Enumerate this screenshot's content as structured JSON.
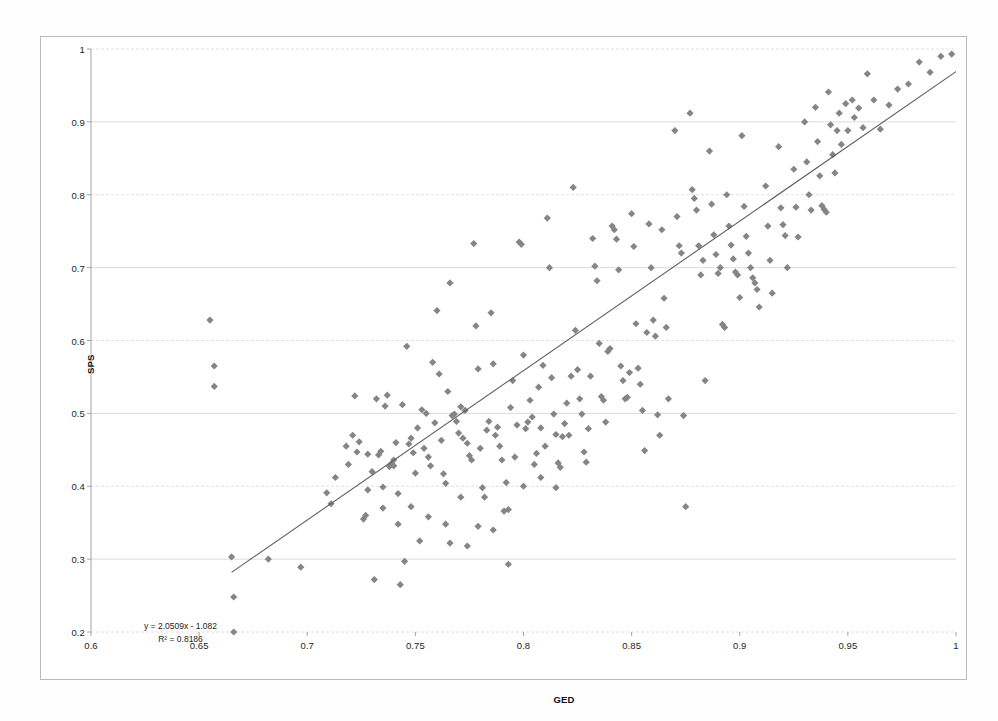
{
  "chart_data": {
    "type": "scatter",
    "title": "",
    "xlabel": "GED",
    "ylabel": "SPS",
    "xlim": [
      0.6,
      1.0
    ],
    "ylim": [
      0.2,
      1.0
    ],
    "xticks": [
      "0.6",
      "0.65",
      "0.7",
      "0.75",
      "0.8",
      "0.85",
      "0.9",
      "0.95",
      "1"
    ],
    "xtick_values": [
      0.6,
      0.65,
      0.7,
      0.75,
      0.8,
      0.85,
      0.9,
      0.95,
      1.0
    ],
    "yticks": [
      "0.2",
      "0.3",
      "0.4",
      "0.5",
      "0.6",
      "0.7",
      "0.8",
      "0.9",
      "1"
    ],
    "ytick_values": [
      0.2,
      0.3,
      0.4,
      0.5,
      0.6,
      0.7,
      0.8,
      0.9,
      1.0
    ],
    "grid": "horizontal",
    "legend": "none",
    "marker_shape": "diamond",
    "marker_color": "#858585",
    "trendline": {
      "type": "linear",
      "slope": 2.0509,
      "intercept": -1.082,
      "r_squared": 0.8186,
      "equation_text": "y = 2.0509x - 1.082",
      "r_squared_text": "R² = 0.8186",
      "color": "#595959",
      "x_start": 0.665,
      "x_end": 1.0
    },
    "n_points": 249,
    "points": [
      [
        0.655,
        0.628
      ],
      [
        0.657,
        0.565
      ],
      [
        0.657,
        0.537
      ],
      [
        0.665,
        0.303
      ],
      [
        0.666,
        0.248
      ],
      [
        0.666,
        0.2
      ],
      [
        0.682,
        0.3
      ],
      [
        0.697,
        0.289
      ],
      [
        0.709,
        0.391
      ],
      [
        0.711,
        0.376
      ],
      [
        0.713,
        0.412
      ],
      [
        0.718,
        0.455
      ],
      [
        0.719,
        0.43
      ],
      [
        0.721,
        0.47
      ],
      [
        0.722,
        0.524
      ],
      [
        0.723,
        0.447
      ],
      [
        0.724,
        0.461
      ],
      [
        0.726,
        0.355
      ],
      [
        0.727,
        0.36
      ],
      [
        0.728,
        0.444
      ],
      [
        0.73,
        0.42
      ],
      [
        0.731,
        0.272
      ],
      [
        0.732,
        0.52
      ],
      [
        0.733,
        0.443
      ],
      [
        0.734,
        0.448
      ],
      [
        0.735,
        0.399
      ],
      [
        0.736,
        0.51
      ],
      [
        0.737,
        0.525
      ],
      [
        0.738,
        0.427
      ],
      [
        0.739,
        0.431
      ],
      [
        0.74,
        0.436
      ],
      [
        0.74,
        0.428
      ],
      [
        0.741,
        0.46
      ],
      [
        0.742,
        0.39
      ],
      [
        0.743,
        0.265
      ],
      [
        0.744,
        0.512
      ],
      [
        0.745,
        0.297
      ],
      [
        0.746,
        0.592
      ],
      [
        0.747,
        0.458
      ],
      [
        0.748,
        0.466
      ],
      [
        0.749,
        0.446
      ],
      [
        0.75,
        0.418
      ],
      [
        0.751,
        0.48
      ],
      [
        0.752,
        0.325
      ],
      [
        0.753,
        0.505
      ],
      [
        0.754,
        0.452
      ],
      [
        0.755,
        0.5
      ],
      [
        0.756,
        0.44
      ],
      [
        0.757,
        0.428
      ],
      [
        0.758,
        0.57
      ],
      [
        0.759,
        0.487
      ],
      [
        0.76,
        0.641
      ],
      [
        0.761,
        0.554
      ],
      [
        0.762,
        0.463
      ],
      [
        0.763,
        0.417
      ],
      [
        0.764,
        0.404
      ],
      [
        0.765,
        0.53
      ],
      [
        0.766,
        0.679
      ],
      [
        0.767,
        0.497
      ],
      [
        0.768,
        0.499
      ],
      [
        0.769,
        0.489
      ],
      [
        0.77,
        0.473
      ],
      [
        0.771,
        0.509
      ],
      [
        0.772,
        0.466
      ],
      [
        0.773,
        0.504
      ],
      [
        0.774,
        0.459
      ],
      [
        0.775,
        0.442
      ],
      [
        0.776,
        0.436
      ],
      [
        0.777,
        0.733
      ],
      [
        0.778,
        0.62
      ],
      [
        0.779,
        0.561
      ],
      [
        0.78,
        0.452
      ],
      [
        0.781,
        0.398
      ],
      [
        0.782,
        0.385
      ],
      [
        0.783,
        0.477
      ],
      [
        0.784,
        0.489
      ],
      [
        0.785,
        0.638
      ],
      [
        0.786,
        0.568
      ],
      [
        0.787,
        0.47
      ],
      [
        0.788,
        0.481
      ],
      [
        0.789,
        0.455
      ],
      [
        0.79,
        0.436
      ],
      [
        0.791,
        0.366
      ],
      [
        0.792,
        0.405
      ],
      [
        0.793,
        0.293
      ],
      [
        0.794,
        0.508
      ],
      [
        0.795,
        0.545
      ],
      [
        0.796,
        0.44
      ],
      [
        0.797,
        0.484
      ],
      [
        0.798,
        0.735
      ],
      [
        0.799,
        0.732
      ],
      [
        0.8,
        0.58
      ],
      [
        0.801,
        0.479
      ],
      [
        0.802,
        0.488
      ],
      [
        0.803,
        0.518
      ],
      [
        0.804,
        0.495
      ],
      [
        0.805,
        0.43
      ],
      [
        0.806,
        0.445
      ],
      [
        0.807,
        0.536
      ],
      [
        0.808,
        0.48
      ],
      [
        0.809,
        0.566
      ],
      [
        0.81,
        0.455
      ],
      [
        0.811,
        0.768
      ],
      [
        0.812,
        0.7
      ],
      [
        0.813,
        0.549
      ],
      [
        0.814,
        0.499
      ],
      [
        0.815,
        0.471
      ],
      [
        0.816,
        0.432
      ],
      [
        0.817,
        0.426
      ],
      [
        0.818,
        0.468
      ],
      [
        0.819,
        0.486
      ],
      [
        0.82,
        0.514
      ],
      [
        0.821,
        0.47
      ],
      [
        0.822,
        0.551
      ],
      [
        0.823,
        0.81
      ],
      [
        0.824,
        0.614
      ],
      [
        0.825,
        0.56
      ],
      [
        0.826,
        0.52
      ],
      [
        0.827,
        0.499
      ],
      [
        0.828,
        0.447
      ],
      [
        0.829,
        0.433
      ],
      [
        0.83,
        0.479
      ],
      [
        0.831,
        0.551
      ],
      [
        0.832,
        0.74
      ],
      [
        0.833,
        0.702
      ],
      [
        0.834,
        0.682
      ],
      [
        0.835,
        0.596
      ],
      [
        0.836,
        0.523
      ],
      [
        0.837,
        0.518
      ],
      [
        0.838,
        0.488
      ],
      [
        0.839,
        0.585
      ],
      [
        0.84,
        0.589
      ],
      [
        0.841,
        0.757
      ],
      [
        0.842,
        0.752
      ],
      [
        0.843,
        0.739
      ],
      [
        0.844,
        0.697
      ],
      [
        0.845,
        0.565
      ],
      [
        0.846,
        0.545
      ],
      [
        0.847,
        0.52
      ],
      [
        0.848,
        0.522
      ],
      [
        0.849,
        0.556
      ],
      [
        0.85,
        0.774
      ],
      [
        0.851,
        0.729
      ],
      [
        0.852,
        0.623
      ],
      [
        0.853,
        0.562
      ],
      [
        0.854,
        0.54
      ],
      [
        0.855,
        0.504
      ],
      [
        0.856,
        0.449
      ],
      [
        0.857,
        0.611
      ],
      [
        0.858,
        0.76
      ],
      [
        0.859,
        0.7
      ],
      [
        0.86,
        0.628
      ],
      [
        0.861,
        0.606
      ],
      [
        0.862,
        0.498
      ],
      [
        0.863,
        0.47
      ],
      [
        0.864,
        0.752
      ],
      [
        0.865,
        0.658
      ],
      [
        0.866,
        0.618
      ],
      [
        0.867,
        0.52
      ],
      [
        0.87,
        0.888
      ],
      [
        0.871,
        0.77
      ],
      [
        0.872,
        0.73
      ],
      [
        0.873,
        0.72
      ],
      [
        0.874,
        0.497
      ],
      [
        0.875,
        0.372
      ],
      [
        0.877,
        0.912
      ],
      [
        0.878,
        0.807
      ],
      [
        0.879,
        0.795
      ],
      [
        0.88,
        0.779
      ],
      [
        0.881,
        0.73
      ],
      [
        0.882,
        0.69
      ],
      [
        0.883,
        0.71
      ],
      [
        0.884,
        0.545
      ],
      [
        0.886,
        0.86
      ],
      [
        0.887,
        0.787
      ],
      [
        0.888,
        0.745
      ],
      [
        0.889,
        0.718
      ],
      [
        0.89,
        0.692
      ],
      [
        0.891,
        0.7
      ],
      [
        0.892,
        0.622
      ],
      [
        0.893,
        0.618
      ],
      [
        0.894,
        0.8
      ],
      [
        0.895,
        0.757
      ],
      [
        0.896,
        0.731
      ],
      [
        0.897,
        0.712
      ],
      [
        0.898,
        0.694
      ],
      [
        0.899,
        0.69
      ],
      [
        0.9,
        0.659
      ],
      [
        0.901,
        0.881
      ],
      [
        0.902,
        0.784
      ],
      [
        0.903,
        0.743
      ],
      [
        0.904,
        0.72
      ],
      [
        0.905,
        0.7
      ],
      [
        0.906,
        0.686
      ],
      [
        0.907,
        0.679
      ],
      [
        0.908,
        0.67
      ],
      [
        0.909,
        0.646
      ],
      [
        0.912,
        0.812
      ],
      [
        0.913,
        0.757
      ],
      [
        0.914,
        0.71
      ],
      [
        0.915,
        0.665
      ],
      [
        0.918,
        0.866
      ],
      [
        0.919,
        0.782
      ],
      [
        0.92,
        0.759
      ],
      [
        0.921,
        0.744
      ],
      [
        0.922,
        0.7
      ],
      [
        0.925,
        0.835
      ],
      [
        0.926,
        0.783
      ],
      [
        0.927,
        0.742
      ],
      [
        0.93,
        0.9
      ],
      [
        0.931,
        0.845
      ],
      [
        0.932,
        0.8
      ],
      [
        0.933,
        0.779
      ],
      [
        0.935,
        0.92
      ],
      [
        0.936,
        0.873
      ],
      [
        0.937,
        0.826
      ],
      [
        0.938,
        0.785
      ],
      [
        0.939,
        0.78
      ],
      [
        0.94,
        0.776
      ],
      [
        0.941,
        0.941
      ],
      [
        0.942,
        0.896
      ],
      [
        0.943,
        0.855
      ],
      [
        0.944,
        0.83
      ],
      [
        0.945,
        0.888
      ],
      [
        0.946,
        0.912
      ],
      [
        0.947,
        0.869
      ],
      [
        0.949,
        0.925
      ],
      [
        0.95,
        0.888
      ],
      [
        0.952,
        0.93
      ],
      [
        0.953,
        0.906
      ],
      [
        0.955,
        0.919
      ],
      [
        0.957,
        0.892
      ],
      [
        0.959,
        0.966
      ],
      [
        0.962,
        0.93
      ],
      [
        0.965,
        0.89
      ],
      [
        0.969,
        0.923
      ],
      [
        0.973,
        0.945
      ],
      [
        0.978,
        0.952
      ],
      [
        0.983,
        0.982
      ],
      [
        0.988,
        0.968
      ],
      [
        0.993,
        0.99
      ],
      [
        0.998,
        0.993
      ],
      [
        0.748,
        0.372
      ],
      [
        0.756,
        0.358
      ],
      [
        0.764,
        0.348
      ],
      [
        0.771,
        0.385
      ],
      [
        0.779,
        0.345
      ],
      [
        0.786,
        0.34
      ],
      [
        0.793,
        0.368
      ],
      [
        0.8,
        0.4
      ],
      [
        0.808,
        0.412
      ],
      [
        0.815,
        0.398
      ],
      [
        0.742,
        0.348
      ],
      [
        0.735,
        0.37
      ],
      [
        0.728,
        0.395
      ],
      [
        0.766,
        0.322
      ],
      [
        0.774,
        0.318
      ]
    ]
  }
}
